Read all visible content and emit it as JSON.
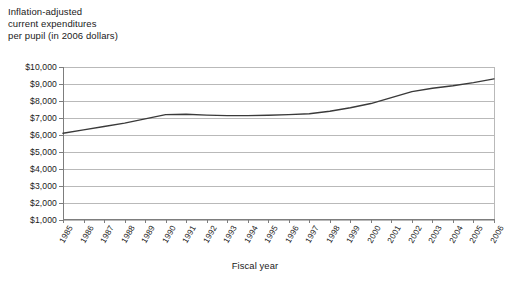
{
  "chart_data": {
    "type": "line",
    "title": "Inflation-adjusted current expenditures per pupil (in 2006 dollars)",
    "title_lines": [
      "Inflation-adjusted",
      "current expenditures",
      "per pupil (in 2006 dollars)"
    ],
    "xlabel": "Fiscal year",
    "ylabel": "",
    "grid": true,
    "legend": "none",
    "line_color": "#3a3a3a",
    "grid_color": "#b9b9b9",
    "axis_color": "#7d7d7d",
    "xlim": [
      1985,
      2006
    ],
    "ylim": [
      1000,
      10000
    ],
    "y_ticks": [
      1000,
      2000,
      3000,
      4000,
      5000,
      6000,
      7000,
      8000,
      9000,
      10000
    ],
    "y_tick_labels": [
      "$1,000",
      "$2,000",
      "$3,000",
      "$4,000",
      "$5,000",
      "$6,000",
      "$7,000",
      "$8,000",
      "$9,000",
      "$10,000"
    ],
    "categories": [
      "1985",
      "1986",
      "1987",
      "1988",
      "1989",
      "1990",
      "1991",
      "1992",
      "1993",
      "1994",
      "1995",
      "1996",
      "1997",
      "1998",
      "1999",
      "2000",
      "2001",
      "2002",
      "2003",
      "2004",
      "2005",
      "2006"
    ],
    "values": [
      6100,
      6300,
      6500,
      6700,
      6950,
      7200,
      7220,
      7170,
      7140,
      7140,
      7160,
      7200,
      7250,
      7400,
      7600,
      7850,
      8200,
      8550,
      8750,
      8900,
      9080,
      9300
    ],
    "series": [
      {
        "name": "Inflation-adjusted current expenditures per pupil",
        "values": [
          6100,
          6300,
          6500,
          6700,
          6950,
          7200,
          7220,
          7170,
          7140,
          7140,
          7160,
          7200,
          7250,
          7400,
          7600,
          7850,
          8200,
          8550,
          8750,
          8900,
          9080,
          9300
        ]
      }
    ]
  }
}
